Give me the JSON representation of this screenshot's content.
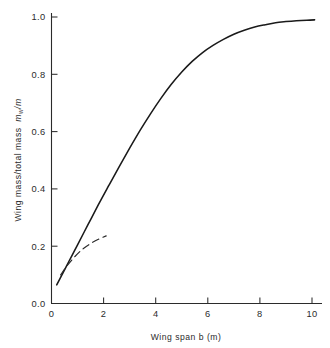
{
  "chart_data": {
    "type": "line",
    "title": "",
    "xlabel": "Wing  span b (m)",
    "ylabel_main": "Wing mass/total mass",
    "ylabel_symbol": "m",
    "ylabel_symbol_sub": "w",
    "ylabel_symbol_tail": "/m",
    "ylabel_full": "Wing mass/total mass  m_w/m",
    "xlim": [
      0,
      10
    ],
    "ylim": [
      0.0,
      1.0
    ],
    "xticks": [
      0,
      2,
      4,
      6,
      8,
      10
    ],
    "xticklabels": [
      "0",
      "2",
      "4",
      "6",
      "8",
      "10"
    ],
    "yticks": [
      0.0,
      0.2,
      0.4,
      0.6,
      0.8,
      1.0
    ],
    "yticklabels": [
      "0.0",
      "0.2",
      "0.4",
      "0.6",
      "0.8",
      "1.0"
    ],
    "grid": false,
    "legend": null,
    "series": [
      {
        "name": "solid-curve",
        "style": "solid",
        "color": "#1a1a1a",
        "x": [
          0.2,
          0.4,
          0.6,
          0.8,
          1.0,
          1.4,
          1.8,
          2.2,
          2.6,
          3.0,
          3.4,
          3.8,
          4.2,
          4.6,
          5.0,
          5.4,
          5.8,
          6.2,
          6.6,
          7.0,
          7.4,
          7.8,
          8.2,
          8.6,
          9.0,
          9.4,
          9.8,
          10.1
        ],
        "y": [
          0.065,
          0.1,
          0.135,
          0.17,
          0.205,
          0.275,
          0.345,
          0.412,
          0.478,
          0.542,
          0.604,
          0.662,
          0.716,
          0.765,
          0.808,
          0.845,
          0.876,
          0.901,
          0.922,
          0.94,
          0.954,
          0.965,
          0.973,
          0.98,
          0.984,
          0.987,
          0.989,
          0.99
        ]
      },
      {
        "name": "dashed-curve",
        "style": "dashed",
        "color": "#2a2a2a",
        "x": [
          0.35,
          0.6,
          0.9,
          1.2,
          1.5,
          1.8,
          2.1
        ],
        "y": [
          0.1,
          0.132,
          0.164,
          0.19,
          0.209,
          0.224,
          0.236
        ]
      }
    ]
  },
  "axes": {
    "x_axis_name": "x-axis",
    "y_axis_name": "y-axis"
  }
}
